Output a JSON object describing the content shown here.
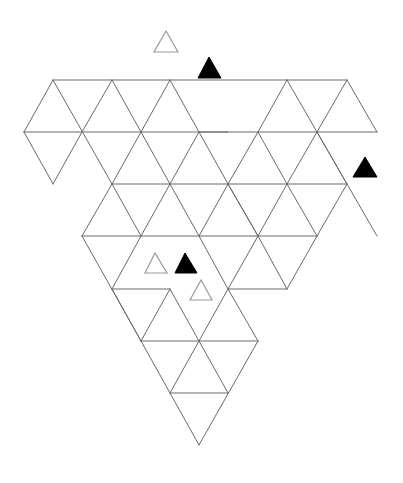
{
  "puzzle": {
    "type": "triangle-grid-puzzle",
    "colors": {
      "background": "#ffffff",
      "grid_line": "#6a6a6a",
      "filled_piece": "#000000",
      "outline_piece": "#9a9a9a"
    },
    "grid_edges": [
      [
        53,
        80,
        287,
        80
      ],
      [
        287,
        80,
        347,
        80
      ],
      [
        24,
        132,
        377,
        132
      ],
      [
        112,
        184,
        347,
        184
      ],
      [
        82,
        236,
        317,
        236
      ],
      [
        112,
        289,
        170,
        289
      ],
      [
        228,
        289,
        287,
        289
      ],
      [
        141,
        341,
        258,
        341
      ],
      [
        170,
        393,
        228,
        393
      ],
      [
        53,
        80,
        24,
        132
      ],
      [
        53,
        80,
        112,
        184
      ],
      [
        112,
        80,
        82,
        132
      ],
      [
        112,
        80,
        141,
        132
      ],
      [
        170,
        80,
        141,
        132
      ],
      [
        170,
        80,
        199,
        132
      ],
      [
        199,
        132,
        228,
        184
      ],
      [
        82,
        132,
        53,
        184
      ],
      [
        24,
        132,
        53,
        184
      ],
      [
        141,
        132,
        112,
        184
      ],
      [
        287,
        80,
        258,
        132
      ],
      [
        287,
        80,
        377,
        236
      ],
      [
        347,
        80,
        317,
        132
      ],
      [
        347,
        80,
        377,
        132
      ],
      [
        228,
        132,
        199,
        132
      ],
      [
        258,
        132,
        228,
        184
      ],
      [
        317,
        132,
        287,
        184
      ],
      [
        317,
        132,
        347,
        184
      ],
      [
        258,
        132,
        287,
        184
      ],
      [
        141,
        132,
        170,
        184
      ],
      [
        199,
        132,
        170,
        184
      ],
      [
        228,
        184,
        258,
        236
      ],
      [
        112,
        184,
        82,
        236
      ],
      [
        112,
        184,
        141,
        236
      ],
      [
        170,
        184,
        141,
        236
      ],
      [
        170,
        184,
        199,
        236
      ],
      [
        228,
        184,
        199,
        236
      ],
      [
        228,
        184,
        258,
        236
      ],
      [
        287,
        184,
        258,
        236
      ],
      [
        287,
        184,
        317,
        236
      ],
      [
        347,
        184,
        317,
        236
      ],
      [
        82,
        236,
        141,
        341
      ],
      [
        141,
        236,
        112,
        289
      ],
      [
        199,
        236,
        228,
        289
      ],
      [
        258,
        236,
        228,
        289
      ],
      [
        258,
        236,
        287,
        289
      ],
      [
        317,
        236,
        287,
        289
      ],
      [
        112,
        289,
        141,
        341
      ],
      [
        170,
        289,
        141,
        341
      ],
      [
        170,
        289,
        199,
        341
      ],
      [
        228,
        289,
        199,
        341
      ],
      [
        228,
        289,
        258,
        341
      ],
      [
        141,
        341,
        199,
        445
      ],
      [
        199,
        341,
        170,
        393
      ],
      [
        199,
        341,
        228,
        393
      ],
      [
        258,
        341,
        199,
        445
      ]
    ],
    "pieces": [
      {
        "kind": "outline",
        "points": [
          [
            166,
            31
          ],
          [
            154,
            52
          ],
          [
            178,
            52
          ]
        ]
      },
      {
        "kind": "filled",
        "points": [
          [
            209,
            57
          ],
          [
            198,
            78
          ],
          [
            221,
            78
          ]
        ]
      },
      {
        "kind": "filled",
        "points": [
          [
            365,
            157
          ],
          [
            353,
            177
          ],
          [
            377,
            177
          ]
        ]
      },
      {
        "kind": "outline",
        "points": [
          [
            155,
            253
          ],
          [
            145,
            273
          ],
          [
            167,
            273
          ]
        ]
      },
      {
        "kind": "filled",
        "points": [
          [
            185,
            253
          ],
          [
            175,
            273
          ],
          [
            197,
            273
          ]
        ]
      },
      {
        "kind": "outline",
        "points": [
          [
            201,
            280
          ],
          [
            190,
            300
          ],
          [
            212,
            300
          ]
        ]
      }
    ]
  }
}
